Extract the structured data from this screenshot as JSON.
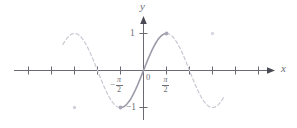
{
  "figure": {
    "background_color": "#ffffff",
    "axis_color": "#6a6a74",
    "solid_curve_color": "#9b9aa8",
    "dashed_curve_color": "#c9c8d2",
    "label_color": "#6f6f78"
  },
  "axes": {
    "x_label": "x",
    "y_label": "y",
    "origin_label": "0",
    "x_tick_labels": [
      {
        "text_sign": "−",
        "numerator": "π",
        "denominator": "2",
        "value": -1.5708
      },
      {
        "text_sign": "",
        "numerator": "π",
        "denominator": "2",
        "value": 1.5708
      }
    ],
    "y_tick_labels": [
      {
        "text": "1",
        "value": 1
      },
      {
        "text": "−1",
        "value": -1
      }
    ],
    "x_range": [
      -5.5,
      5.5
    ],
    "y_range": [
      -1.35,
      1.45
    ],
    "x_tick_values": [
      -4.712,
      -3.927,
      -3.142,
      -2.356,
      -1.571,
      0.785,
      1.571,
      2.356,
      3.142,
      3.927,
      4.712
    ],
    "y_tick_values": [
      1,
      -1
    ],
    "grid": false
  },
  "chart_data": {
    "type": "line",
    "xlabel": "x",
    "ylabel": "y",
    "xlim": [
      -5.5,
      5.5
    ],
    "ylim": [
      -1.35,
      1.45
    ],
    "grid": false,
    "legend": null,
    "series": [
      {
        "name": "sin x (principal branch, solid)",
        "style": "solid",
        "color": "#9b9aa8",
        "x_domain": [
          -1.5708,
          1.5708
        ],
        "points": [
          {
            "x": -1.5708,
            "y": -1
          },
          {
            "x": -1.1781,
            "y": -0.9239
          },
          {
            "x": -0.7854,
            "y": -0.7071
          },
          {
            "x": -0.3927,
            "y": -0.3827
          },
          {
            "x": 0,
            "y": 0
          },
          {
            "x": 0.3927,
            "y": 0.3827
          },
          {
            "x": 0.7854,
            "y": 0.7071
          },
          {
            "x": 1.1781,
            "y": 0.9239
          },
          {
            "x": 1.5708,
            "y": 1
          }
        ]
      },
      {
        "name": "sin x (remaining branches, dashed)",
        "style": "dashed",
        "color": "#c9c8d2",
        "x_domain": [
          -5.5,
          5.5
        ],
        "excluded_domain": [
          -1.5708,
          1.5708
        ]
      }
    ],
    "markers": [
      {
        "name": "endpoint-max",
        "x": 1.5708,
        "y": 1,
        "emphasis": "strong"
      },
      {
        "name": "endpoint-min",
        "x": -1.5708,
        "y": -1,
        "emphasis": "strong"
      },
      {
        "name": "far-left-min",
        "x": -4.712,
        "y": -1,
        "emphasis": "faint"
      },
      {
        "name": "far-right-max",
        "x": 4.712,
        "y": 1,
        "emphasis": "faint"
      }
    ]
  }
}
